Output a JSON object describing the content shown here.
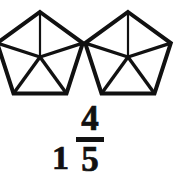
{
  "figure": {
    "type": "fraction-model",
    "shape_name": "pentagon",
    "shape_count": 2,
    "parts_per_shape": 5,
    "stroke_color": "#111111",
    "fill_color": "#ffffff",
    "background_color": "#ffffff",
    "shapes": [
      {
        "label": "pentagon-1",
        "center_x": 40,
        "center_y": 57,
        "radius": 45,
        "sections": 5
      },
      {
        "label": "pentagon-2",
        "center_x": 128,
        "center_y": 57,
        "radius": 45,
        "sections": 5
      }
    ]
  },
  "mixed_number": {
    "whole": "1",
    "numerator": "4",
    "denominator": "5",
    "text": "1 4/5"
  }
}
